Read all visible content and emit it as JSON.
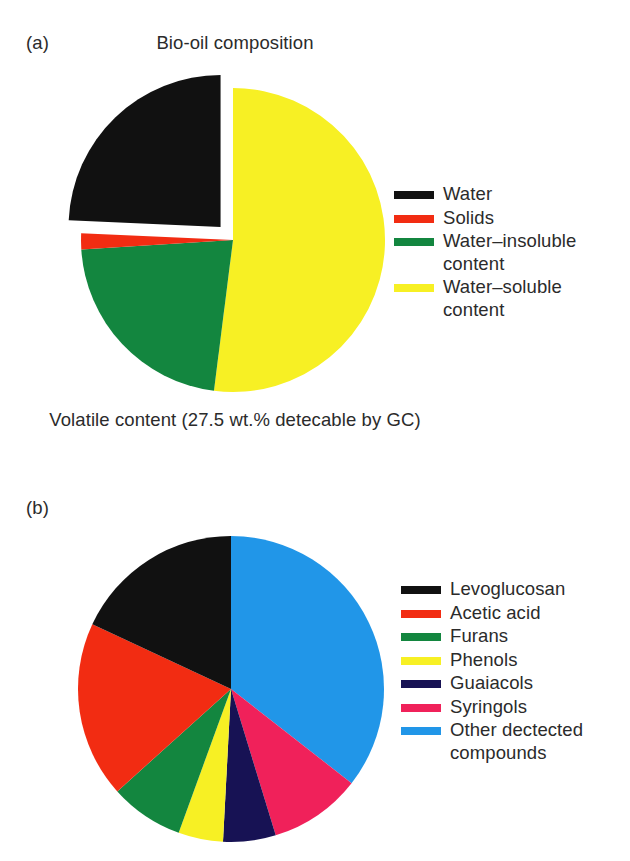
{
  "figure": {
    "background": "#ffffff",
    "text_color": "#2b2b2b"
  },
  "panel_a": {
    "tag": "(a)",
    "title": "Bio-oil composition",
    "caption": "Volatile content\n(27.5 wt.% detecable by GC)",
    "legend": [
      {
        "label": "Water",
        "color": "#111111"
      },
      {
        "label": "Solids",
        "color": "#f22c12"
      },
      {
        "label": "Water–insoluble\ncontent",
        "color": "#13863f"
      },
      {
        "label": "Water–soluble\ncontent",
        "color": "#f7f024"
      }
    ]
  },
  "panel_b": {
    "tag": "(b)",
    "legend": [
      {
        "label": "Levoglucosan",
        "color": "#111111"
      },
      {
        "label": "Acetic acid",
        "color": "#f22c12"
      },
      {
        "label": "Furans",
        "color": "#13863f"
      },
      {
        "label": "Phenols",
        "color": "#f7f024"
      },
      {
        "label": "Guaiacols",
        "color": "#171254"
      },
      {
        "label": "Syringols",
        "color": "#f0215a"
      },
      {
        "label": "Other dectected\ncompounds",
        "color": "#2196e8"
      }
    ]
  },
  "chart_data": [
    {
      "type": "pie",
      "id": "bio-oil-composition",
      "title": "Bio-oil composition",
      "subtitle": "Volatile content (27.5 wt.% detecable by GC)",
      "panel": "(a)",
      "units": "percent",
      "start_angle_deg": 0,
      "direction": "clockwise",
      "center_px": [
        233,
        240
      ],
      "radius_px": 152,
      "legend_position": "right",
      "categories": [
        "Water–soluble content",
        "Water–insoluble content",
        "Solids",
        "Water"
      ],
      "values": [
        52.0,
        22.0,
        1.7,
        24.3
      ],
      "colors": [
        "#f7f024",
        "#13863f",
        "#f22c12",
        "#111111"
      ],
      "exploded": [
        "Water"
      ],
      "explode_offset_px": 18,
      "slice_angles_deg": [
        {
          "name": "Water–soluble content",
          "start": 0,
          "end": 187.2
        },
        {
          "name": "Water–insoluble content",
          "start": 187.2,
          "end": 266.4
        },
        {
          "name": "Solids",
          "start": 266.4,
          "end": 272.5
        },
        {
          "name": "Water",
          "start": 272.5,
          "end": 360
        }
      ]
    },
    {
      "type": "pie",
      "id": "volatile-content-gc",
      "title": "",
      "panel": "(b)",
      "units": "percent",
      "start_angle_deg": 0,
      "direction": "clockwise",
      "center_px": [
        231,
        689
      ],
      "radius_px": 153,
      "legend_position": "right",
      "categories": [
        "Other dectected compounds",
        "Syringols",
        "Guaiacols",
        "Phenols",
        "Furans",
        "Acetic acid",
        "Levoglucosan"
      ],
      "values": [
        35.6,
        9.7,
        5.6,
        4.7,
        7.8,
        18.6,
        18.0
      ],
      "colors": [
        "#2196e8",
        "#f0215a",
        "#171254",
        "#f7f024",
        "#13863f",
        "#f22c12",
        "#111111"
      ],
      "slice_angles_deg": [
        {
          "name": "Other dectected compounds",
          "start": 0,
          "end": 128.0
        },
        {
          "name": "Syringols",
          "start": 128.0,
          "end": 163.0
        },
        {
          "name": "Guaiacols",
          "start": 163.0,
          "end": 183.0
        },
        {
          "name": "Phenols",
          "start": 183.0,
          "end": 200.0
        },
        {
          "name": "Furans",
          "start": 200.0,
          "end": 228.0
        },
        {
          "name": "Acetic acid",
          "start": 228.0,
          "end": 295.0
        },
        {
          "name": "Levoglucosan",
          "start": 295.0,
          "end": 360.0
        }
      ]
    }
  ]
}
